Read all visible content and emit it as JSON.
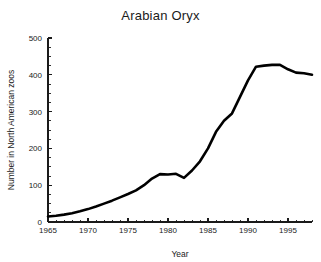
{
  "chart_data": {
    "type": "line",
    "title": "Arabian Oryx",
    "xlabel": "Year",
    "ylabel": "Number in North American zoos",
    "xlim": [
      1965,
      1998
    ],
    "ylim": [
      0,
      500
    ],
    "grid": false,
    "legend": null,
    "x_ticks": [
      1965,
      1970,
      1975,
      1980,
      1985,
      1990,
      1995
    ],
    "x_tick_labels": [
      "1965",
      "1970",
      "1975",
      "1980",
      "1985",
      "1990",
      "1995"
    ],
    "x_minor_tick_step": 1,
    "y_ticks": [
      0,
      100,
      200,
      300,
      400,
      500
    ],
    "y_tick_labels": [
      "0",
      "100",
      "200",
      "300",
      "400",
      "500"
    ],
    "y_minor_tick_step": 25,
    "series": [
      {
        "name": "Arabian Oryx in North American zoos",
        "color": "#000000",
        "x": [
          1965,
          1966,
          1967,
          1968,
          1969,
          1970,
          1971,
          1972,
          1973,
          1974,
          1975,
          1976,
          1977,
          1978,
          1979,
          1980,
          1981,
          1982,
          1983,
          1984,
          1985,
          1986,
          1987,
          1988,
          1989,
          1990,
          1991,
          1992,
          1993,
          1994,
          1995,
          1996,
          1997,
          1998
        ],
        "values": [
          15,
          17,
          20,
          24,
          29,
          35,
          42,
          50,
          58,
          67,
          76,
          86,
          100,
          118,
          130,
          129,
          131,
          120,
          140,
          165,
          200,
          245,
          275,
          295,
          340,
          385,
          422,
          425,
          427,
          427,
          415,
          406,
          404,
          400
        ]
      }
    ]
  },
  "layout": {
    "plot_left_px": 48,
    "plot_right_px": 312,
    "plot_top_px": 38,
    "plot_bottom_px": 222
  }
}
